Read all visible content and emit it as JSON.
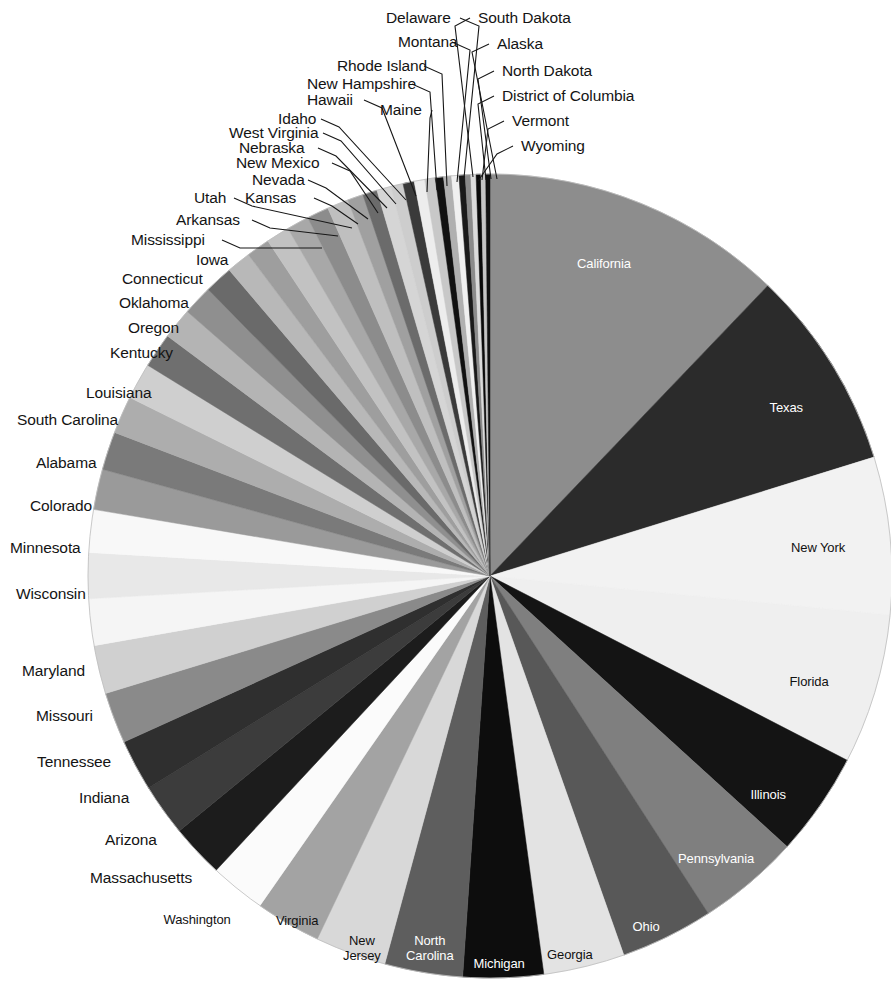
{
  "chart_data": {
    "type": "pie",
    "title": "",
    "subtitle": "",
    "xlabel": "",
    "ylabel": "",
    "legend_position": "none",
    "grid": false,
    "start_angle_deg": 0,
    "direction": "clockwise",
    "categories": [
      "California",
      "Texas",
      "New York",
      "Florida",
      "Illinois",
      "Pennsylvania",
      "Ohio",
      "Georgia",
      "Michigan",
      "North Carolina",
      "New Jersey",
      "Virginia",
      "Washington",
      "Massachusetts",
      "Arizona",
      "Indiana",
      "Tennessee",
      "Missouri",
      "Maryland",
      "Wisconsin",
      "Minnesota",
      "Colorado",
      "Alabama",
      "South Carolina",
      "Louisiana",
      "Kentucky",
      "Oregon",
      "Oklahoma",
      "Connecticut",
      "Iowa",
      "Mississippi",
      "Arkansas",
      "Kansas",
      "Utah",
      "Nevada",
      "New Mexico",
      "Nebraska",
      "West Virginia",
      "Idaho",
      "Hawaii",
      "Maine",
      "New Hampshire",
      "Rhode Island",
      "Montana",
      "Delaware",
      "South Dakota",
      "Alaska",
      "North Dakota",
      "District of Columbia",
      "Vermont",
      "Wyoming"
    ],
    "values": [
      12.1,
      8.04,
      6.3,
      6.01,
      4.16,
      4.09,
      3.72,
      3.25,
      3.21,
      3.12,
      2.84,
      2.62,
      2.22,
      2.13,
      2.08,
      2.06,
      2.05,
      1.94,
      1.86,
      1.83,
      1.71,
      1.62,
      1.53,
      1.5,
      1.46,
      1.39,
      1.24,
      1.2,
      1.13,
      0.97,
      0.94,
      0.93,
      0.89,
      0.88,
      0.85,
      0.63,
      0.58,
      0.57,
      0.49,
      0.45,
      0.42,
      0.42,
      0.33,
      0.32,
      0.29,
      0.25,
      0.22,
      0.21,
      0.19,
      0.19,
      0.17
    ],
    "colors": [
      "#8d8d8d",
      "#2b2b2b",
      "#f2f2f2",
      "#efefef",
      "#141414",
      "#7f7f7f",
      "#585858",
      "#e3e3e3",
      "#0d0d0d",
      "#5e5e5e",
      "#d8d8d8",
      "#a3a3a3",
      "#fbfbfb",
      "#1c1c1c",
      "#3c3c3c",
      "#2f2f2f",
      "#8a8a8a",
      "#d0d0d0",
      "#f5f5f5",
      "#e8e8e8",
      "#f8f8f8",
      "#9a9a9a",
      "#7a7a7a",
      "#adadad",
      "#cfcfcf",
      "#6f6f6f",
      "#b4b4b4",
      "#8f8f8f",
      "#6a6a6a",
      "#b8b8b8",
      "#9e9e9e",
      "#c2c2c2",
      "#a8a8a8",
      "#8c8c8c",
      "#bfbfbf",
      "#a0a0a0",
      "#6b6b6b",
      "#d5d5d5",
      "#cdcdcd",
      "#3a3a3a",
      "#ededed",
      "#c8c8c8",
      "#111111",
      "#b0b0b0",
      "#f0f0f0",
      "#1a1a1a",
      "#8b8b8b",
      "#dcdcdc",
      "#0a0a0a",
      "#c5c5c5",
      "#111111"
    ],
    "units": "percent of total",
    "annotations": []
  },
  "geometry": {
    "cx": 490,
    "cy": 576,
    "r": 402
  },
  "inside_labels": [
    {
      "name": "California",
      "lines": [
        "California"
      ],
      "x": 604,
      "y": 264,
      "tone": "light"
    },
    {
      "name": "Texas",
      "lines": [
        "Texas"
      ],
      "x": 786,
      "y": 408,
      "tone": "light"
    },
    {
      "name": "New York",
      "lines": [
        "New York"
      ],
      "x": 818,
      "y": 548,
      "tone": "dark"
    },
    {
      "name": "Florida",
      "lines": [
        "Florida"
      ],
      "x": 809,
      "y": 682,
      "tone": "dark"
    },
    {
      "name": "Illinois",
      "lines": [
        "Illinois"
      ],
      "x": 768,
      "y": 795,
      "tone": "light"
    },
    {
      "name": "Pennsylvania",
      "lines": [
        "Pennsylvania"
      ],
      "x": 716,
      "y": 859,
      "tone": "light"
    },
    {
      "name": "Ohio",
      "lines": [
        "Ohio"
      ],
      "x": 646,
      "y": 927,
      "tone": "light"
    },
    {
      "name": "Georgia",
      "lines": [
        "Georgia"
      ],
      "x": 570,
      "y": 955,
      "tone": "dark"
    },
    {
      "name": "Michigan",
      "lines": [
        "Michigan"
      ],
      "x": 499,
      "y": 964,
      "tone": "light"
    },
    {
      "name": "North Carolina",
      "lines": [
        "North",
        "Carolina"
      ],
      "x": 430,
      "y": 948,
      "tone": "light"
    },
    {
      "name": "New Jersey",
      "lines": [
        "New",
        "Jersey"
      ],
      "x": 362,
      "y": 948,
      "tone": "dark"
    },
    {
      "name": "Virginia",
      "lines": [
        "Virginia"
      ],
      "x": 297,
      "y": 921,
      "tone": "dark"
    },
    {
      "name": "Washington",
      "lines": [
        "Washington"
      ],
      "x": 197,
      "y": 920,
      "tone": "dark"
    }
  ],
  "outside_labels": [
    {
      "name": "Delaware",
      "text": "Delaware",
      "x": 386,
      "y": 10,
      "anchor": "start"
    },
    {
      "name": "South Dakota",
      "text": "South Dakota",
      "x": 478,
      "y": 10,
      "anchor": "start"
    },
    {
      "name": "Montana",
      "text": "Montana",
      "x": 398,
      "y": 34,
      "anchor": "start"
    },
    {
      "name": "Alaska",
      "text": "Alaska",
      "x": 497,
      "y": 36,
      "anchor": "start"
    },
    {
      "name": "Rhode Island",
      "text": "Rhode Island",
      "x": 337,
      "y": 58,
      "anchor": "start"
    },
    {
      "name": "North Dakota",
      "text": "North Dakota",
      "x": 502,
      "y": 63,
      "anchor": "start"
    },
    {
      "name": "New Hampshire",
      "text": "New Hampshire",
      "x": 307,
      "y": 76,
      "anchor": "start"
    },
    {
      "name": "District of Columbia",
      "text": "District of Columbia",
      "x": 502,
      "y": 88,
      "anchor": "start"
    },
    {
      "name": "Hawaii",
      "text": "Hawaii",
      "x": 307,
      "y": 92,
      "anchor": "start"
    },
    {
      "name": "Maine",
      "text": "Maine",
      "x": 380,
      "y": 102,
      "anchor": "start"
    },
    {
      "name": "Idaho",
      "text": "Idaho",
      "x": 278,
      "y": 111,
      "anchor": "start"
    },
    {
      "name": "Vermont",
      "text": "Vermont",
      "x": 512,
      "y": 113,
      "anchor": "start"
    },
    {
      "name": "West Virginia",
      "text": "West Virginia",
      "x": 229,
      "y": 125,
      "anchor": "start"
    },
    {
      "name": "Wyoming",
      "text": "Wyoming",
      "x": 521,
      "y": 138,
      "anchor": "start"
    },
    {
      "name": "Nebraska",
      "text": "Nebraska",
      "x": 239,
      "y": 140,
      "anchor": "start"
    },
    {
      "name": "New Mexico",
      "text": "New Mexico",
      "x": 236,
      "y": 155,
      "anchor": "start"
    },
    {
      "name": "Nevada",
      "text": "Nevada",
      "x": 252,
      "y": 172,
      "anchor": "start"
    },
    {
      "name": "Utah",
      "text": "Utah",
      "x": 194,
      "y": 190,
      "anchor": "start"
    },
    {
      "name": "Kansas",
      "text": "Kansas",
      "x": 245,
      "y": 190,
      "anchor": "start"
    },
    {
      "name": "Arkansas",
      "text": "Arkansas",
      "x": 176,
      "y": 212,
      "anchor": "start"
    },
    {
      "name": "Mississippi",
      "text": "Mississippi",
      "x": 131,
      "y": 232,
      "anchor": "start"
    },
    {
      "name": "Iowa",
      "text": "Iowa",
      "x": 196,
      "y": 252,
      "anchor": "start"
    },
    {
      "name": "Connecticut",
      "text": "Connecticut",
      "x": 122,
      "y": 271,
      "anchor": "start"
    },
    {
      "name": "Oklahoma",
      "text": "Oklahoma",
      "x": 119,
      "y": 295,
      "anchor": "start"
    },
    {
      "name": "Oregon",
      "text": "Oregon",
      "x": 128,
      "y": 320,
      "anchor": "start"
    },
    {
      "name": "Kentucky",
      "text": "Kentucky",
      "x": 110,
      "y": 345,
      "anchor": "start"
    },
    {
      "name": "Louisiana",
      "text": "Louisiana",
      "x": 86,
      "y": 385,
      "anchor": "start"
    },
    {
      "name": "South Carolina",
      "text": "South Carolina",
      "x": 17,
      "y": 412,
      "anchor": "start"
    },
    {
      "name": "Alabama",
      "text": "Alabama",
      "x": 36,
      "y": 455,
      "anchor": "start"
    },
    {
      "name": "Colorado",
      "text": "Colorado",
      "x": 30,
      "y": 498,
      "anchor": "start"
    },
    {
      "name": "Minnesota",
      "text": "Minnesota",
      "x": 10,
      "y": 540,
      "anchor": "start"
    },
    {
      "name": "Wisconsin",
      "text": "Wisconsin",
      "x": 16,
      "y": 586,
      "anchor": "start"
    },
    {
      "name": "Maryland",
      "text": "Maryland",
      "x": 22,
      "y": 663,
      "anchor": "start"
    },
    {
      "name": "Missouri",
      "text": "Missouri",
      "x": 36,
      "y": 708,
      "anchor": "start"
    },
    {
      "name": "Tennessee",
      "text": "Tennessee",
      "x": 37,
      "y": 754,
      "anchor": "start"
    },
    {
      "name": "Indiana",
      "text": "Indiana",
      "x": 79,
      "y": 790,
      "anchor": "start"
    },
    {
      "name": "Arizona",
      "text": "Arizona",
      "x": 105,
      "y": 832,
      "anchor": "start"
    },
    {
      "name": "Massachusetts",
      "text": "Massachusetts",
      "x": 90,
      "y": 870,
      "anchor": "start"
    }
  ],
  "leader_lines": [
    {
      "name": "leader-delaware",
      "x1": 460,
      "y1": 18,
      "x2": 479,
      "y2": 26,
      "x3": 464,
      "y3": 178
    },
    {
      "name": "leader-south-dakota",
      "x1": 470,
      "y1": 18,
      "x2": 455,
      "y2": 26,
      "x3": 473,
      "y3": 177
    },
    {
      "name": "leader-montana",
      "x1": 452,
      "y1": 42,
      "x2": 470,
      "y2": 50,
      "x3": 457,
      "y3": 182
    },
    {
      "name": "leader-alaska",
      "x1": 489,
      "y1": 44,
      "x2": 472,
      "y2": 52,
      "x3": 497,
      "y3": 179
    },
    {
      "name": "leader-rhode-island",
      "x1": 424,
      "y1": 66,
      "x2": 442,
      "y2": 74,
      "x3": 447,
      "y3": 186
    },
    {
      "name": "leader-north-dakota",
      "x1": 494,
      "y1": 71,
      "x2": 478,
      "y2": 79,
      "x3": 491,
      "y3": 179
    },
    {
      "name": "leader-new-hampshire",
      "x1": 412,
      "y1": 84,
      "x2": 430,
      "y2": 92,
      "x3": 437,
      "y3": 190
    },
    {
      "name": "leader-dc",
      "x1": 494,
      "y1": 96,
      "x2": 478,
      "y2": 104,
      "x3": 486,
      "y3": 180
    },
    {
      "name": "leader-hawaii",
      "x1": 364,
      "y1": 100,
      "x2": 382,
      "y2": 108,
      "x3": 416,
      "y3": 196
    },
    {
      "name": "leader-maine",
      "x1": 432,
      "y1": 110,
      "x2": 430,
      "y2": 118,
      "x3": 427,
      "y3": 192
    },
    {
      "name": "leader-idaho",
      "x1": 321,
      "y1": 119,
      "x2": 339,
      "y2": 127,
      "x3": 406,
      "y3": 200
    },
    {
      "name": "leader-vermont",
      "x1": 504,
      "y1": 121,
      "x2": 488,
      "y2": 129,
      "x3": 482,
      "y3": 180
    },
    {
      "name": "leader-west-virginia",
      "x1": 323,
      "y1": 133,
      "x2": 341,
      "y2": 141,
      "x3": 396,
      "y3": 204
    },
    {
      "name": "leader-wyoming",
      "x1": 513,
      "y1": 146,
      "x2": 497,
      "y2": 154,
      "x3": 478,
      "y3": 181
    },
    {
      "name": "leader-nebraska",
      "x1": 318,
      "y1": 148,
      "x2": 336,
      "y2": 156,
      "x3": 387,
      "y3": 208
    },
    {
      "name": "leader-new-mexico",
      "x1": 332,
      "y1": 163,
      "x2": 350,
      "y2": 171,
      "x3": 378,
      "y3": 213
    },
    {
      "name": "leader-nevada",
      "x1": 308,
      "y1": 180,
      "x2": 326,
      "y2": 188,
      "x3": 368,
      "y3": 219
    },
    {
      "name": "leader-utah",
      "x1": 234,
      "y1": 198,
      "x2": 252,
      "y2": 206,
      "x3": 352,
      "y3": 228
    },
    {
      "name": "leader-kansas",
      "x1": 314,
      "y1": 198,
      "x2": 332,
      "y2": 206,
      "x3": 358,
      "y3": 224
    },
    {
      "name": "leader-arkansas",
      "x1": 252,
      "y1": 220,
      "x2": 270,
      "y2": 228,
      "x3": 338,
      "y3": 236
    },
    {
      "name": "leader-mississippi",
      "x1": 222,
      "y1": 240,
      "x2": 240,
      "y2": 248,
      "x3": 322,
      "y3": 248
    }
  ]
}
